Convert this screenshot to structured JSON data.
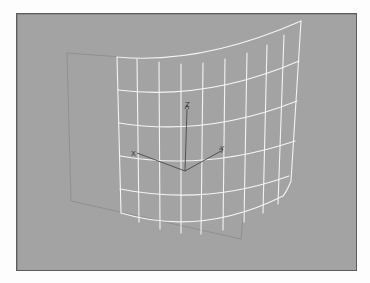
{
  "viewport": {
    "name": "perspective-viewport",
    "background_color": "#a3a3a3",
    "border_color": "#5c5c5c"
  },
  "scene": {
    "object": "bent-plane-mesh",
    "wireframe_color": "#f4f4f4",
    "grid_columns": 10,
    "grid_rows": 6,
    "reference_plane_color": "#8c8c8c"
  },
  "gizmo": {
    "color": "#4a4a4a",
    "x_label": "X",
    "y_label": "Y",
    "z_label": "Z"
  }
}
